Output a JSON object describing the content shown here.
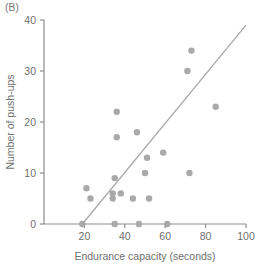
{
  "panel": {
    "label": "(B)"
  },
  "colors": {
    "marker": "#a9a9a9",
    "line": "#a9a9a9",
    "axis": "#8c8c8c",
    "text": "#6f6f6f",
    "background": "#ffffff"
  },
  "chart_data": {
    "type": "scatter",
    "title": "(B)",
    "xlabel": "Endurance capacity (seconds)",
    "ylabel": "Number of push-ups",
    "xlim": [
      0,
      100
    ],
    "ylim": [
      0,
      40
    ],
    "xticks": [
      20,
      40,
      60,
      80,
      100
    ],
    "yticks": [
      0,
      10,
      20,
      30,
      40
    ],
    "grid": false,
    "legend": null,
    "points": [
      {
        "x": 19,
        "y": 0
      },
      {
        "x": 21,
        "y": 7
      },
      {
        "x": 23,
        "y": 5
      },
      {
        "x": 34,
        "y": 5
      },
      {
        "x": 34,
        "y": 6
      },
      {
        "x": 35,
        "y": 9
      },
      {
        "x": 35,
        "y": 0
      },
      {
        "x": 36,
        "y": 22
      },
      {
        "x": 36,
        "y": 17
      },
      {
        "x": 38,
        "y": 6
      },
      {
        "x": 44,
        "y": 5
      },
      {
        "x": 46,
        "y": 18
      },
      {
        "x": 47,
        "y": 0
      },
      {
        "x": 50,
        "y": 10
      },
      {
        "x": 51,
        "y": 13
      },
      {
        "x": 52,
        "y": 5
      },
      {
        "x": 59,
        "y": 14
      },
      {
        "x": 61,
        "y": 0
      },
      {
        "x": 71,
        "y": 30
      },
      {
        "x": 72,
        "y": 10
      },
      {
        "x": 73,
        "y": 34
      },
      {
        "x": 85,
        "y": 23
      }
    ],
    "series": [
      {
        "name": "Participants",
        "marker": "circle",
        "color": "#a9a9a9"
      }
    ],
    "trendline": {
      "type": "linear",
      "x_start": 19,
      "y_start": 0,
      "x_end": 100,
      "y_end": 39,
      "color": "#a9a9a9"
    }
  }
}
